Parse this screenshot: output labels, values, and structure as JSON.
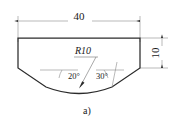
{
  "figure": {
    "caption": "a)",
    "dimensions": {
      "width_label": "40",
      "height_label": "10",
      "radius_label": "R10",
      "left_angle_label": "20°",
      "right_angle_label": "30°"
    },
    "colors": {
      "outline": "#2b2b2b",
      "thin_line": "#8a8a8a",
      "text": "#1a1a1a",
      "background": "#ffffff"
    }
  }
}
